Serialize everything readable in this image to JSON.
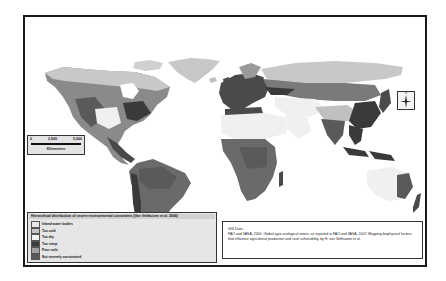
{
  "map": {
    "type": "thematic-world-map",
    "colors": {
      "frame": "#1a1a1a",
      "ocean": "#ffffff",
      "too_cold": "#c8c8c8",
      "too_dry": "#f2f2f2",
      "too_steep": "#3a3a3a",
      "poor_soils": "#a0a0a0",
      "not_severely_constrained": "#606060",
      "inland_water": "#e8e8e8"
    }
  },
  "scale_bar": {
    "ticks": [
      "0",
      "2,500",
      "5,000"
    ],
    "unit": "Kilometers"
  },
  "north_arrow": {
    "label": "N",
    "icon": "north-arrow-icon"
  },
  "legend": {
    "title": "Hierarchical distribution of severe environmental constraints (Van Velthuizen et al. 2006)",
    "items": [
      {
        "label": "Inland water bodies",
        "color": "#e8e8e8"
      },
      {
        "label": "Too cold",
        "color": "#c8c8c8"
      },
      {
        "label": "Too dry",
        "color": "#f4f4f4"
      },
      {
        "label": "Too steep",
        "color": "#3a3a3a"
      },
      {
        "label": "Poor soils",
        "color": "#a0a0a0"
      },
      {
        "label": "Not severely constrained",
        "color": "#5a5a5a"
      }
    ]
  },
  "source": {
    "heading": "GIS Data:",
    "text": "FAO and IIASA, 2000, Global agro-ecological zones, as reported in FAO and IIASA, 2007, Mapping biophysical factors that influence agricultural production and rural vulnerability, by H. von Velthuizen et al."
  }
}
